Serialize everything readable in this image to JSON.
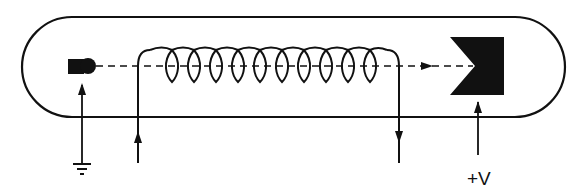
{
  "diagram": {
    "type": "vacuum tube / traveling-wave tube schematic",
    "colors": {
      "line": "#111111",
      "fill": "#111111",
      "background": "#ffffff"
    },
    "components": [
      {
        "id": "tube-envelope",
        "shape": "stadium outline"
      },
      {
        "id": "cathode",
        "shape": "block with rounded emitter tip",
        "connection": "ground"
      },
      {
        "id": "beam",
        "shape": "dashed line with arrow pointing right"
      },
      {
        "id": "helix-coil",
        "shape": "helix",
        "turns": 10,
        "leads": [
          "input (arrow up)",
          "output (arrow down)"
        ]
      },
      {
        "id": "anode",
        "shape": "notched block (collector)",
        "connection": "+V"
      }
    ],
    "labels": {
      "anode_voltage": "+V"
    },
    "symbols": {
      "ground": "ground-symbol"
    }
  }
}
